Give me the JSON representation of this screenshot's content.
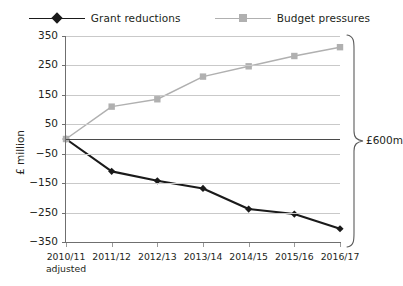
{
  "chart_data": {
    "type": "line",
    "title": "",
    "xlabel": "",
    "ylabel": "£ million",
    "categories": [
      "2010/11",
      "2011/12",
      "2012/13",
      "2013/14",
      "2014/15",
      "2015/16",
      "2016/17"
    ],
    "category_sublabels": [
      "adjusted",
      "",
      "",
      "",
      "",
      "",
      ""
    ],
    "ylim": [
      -350,
      350
    ],
    "yticks": [
      350,
      250,
      150,
      50,
      -50,
      -150,
      -250,
      -350
    ],
    "ytick_labels": [
      "350",
      "250",
      "150",
      "50",
      "−50",
      "−150",
      "−250",
      "−350"
    ],
    "grid": true,
    "zero_line": true,
    "legend_position": "top",
    "series": [
      {
        "name": "Grant reductions",
        "color": "#1a1a1a",
        "marker": "diamond",
        "values": [
          0,
          -110,
          -142,
          -168,
          -238,
          -255,
          -305
        ]
      },
      {
        "name": "Budget pressures",
        "color": "#b0b0b0",
        "marker": "square",
        "values": [
          0,
          110,
          135,
          212,
          247,
          282,
          312
        ]
      }
    ],
    "annotations": [
      {
        "name": "total-range-brace",
        "label": "£600m",
        "shape": "curly-brace",
        "spans_from": 350,
        "spans_to": -350
      }
    ]
  },
  "colors": {
    "grant_reductions": "#1a1a1a",
    "budget_pressures": "#b0b0b0",
    "gridline": "#c9c9c9",
    "axis": "#6f6f6f",
    "zero_line": "#4a4a4a",
    "text": "#231f20",
    "background": "#ffffff"
  }
}
